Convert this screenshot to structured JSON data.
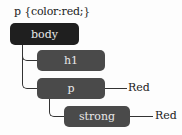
{
  "title": "p {color:red;}",
  "nodes": {
    "body": {
      "label": "body"
    },
    "h1": {
      "label": "h1"
    },
    "p": {
      "label": "p",
      "value": "Red"
    },
    "strong": {
      "label": "strong",
      "value": "Red"
    }
  },
  "colors": {
    "root_fill": "#1f1f1f",
    "child_fill": "#4a4a4a",
    "node_text": "#e8e8e8",
    "line": "#333333"
  }
}
